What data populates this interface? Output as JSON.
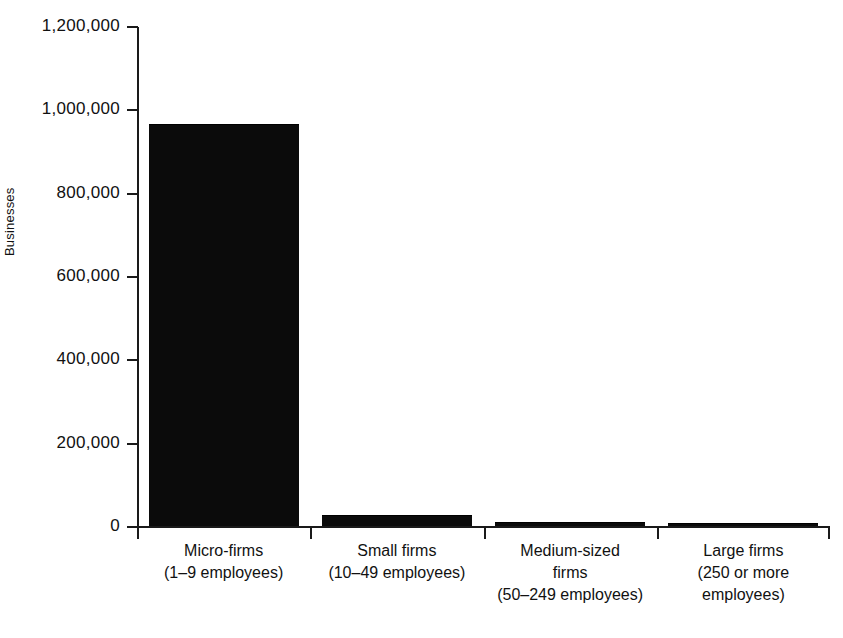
{
  "chart_data": {
    "type": "bar",
    "title": "",
    "xlabel": "",
    "ylabel": "Businesses",
    "ylim": [
      0,
      1200000
    ],
    "ytick_values": [
      0,
      200000,
      400000,
      600000,
      800000,
      1000000,
      1200000
    ],
    "ytick_labels": [
      "0",
      "200,000",
      "400,000",
      "600,000",
      "800,000",
      "1,000,000",
      "1,200,000"
    ],
    "grid": false,
    "legend": false,
    "bar_color": "#0b0b0b",
    "categories": [
      "Micro-firms (1–9 employees)",
      "Small firms (10–49 employees)",
      "Medium-sized firms (50–249 employees)",
      "Large firms (250 or more employees)"
    ],
    "category_lines": [
      [
        "Micro-firms",
        "(1–9 employees)"
      ],
      [
        "Small firms",
        "(10–49 employees)"
      ],
      [
        "Medium-sized",
        "firms",
        "(50–249 employees)"
      ],
      [
        "Large firms",
        "(250 or more",
        "employees)"
      ]
    ],
    "values": [
      965000,
      26000,
      10000,
      7000
    ]
  },
  "axes": {
    "y_title": "Businesses"
  }
}
